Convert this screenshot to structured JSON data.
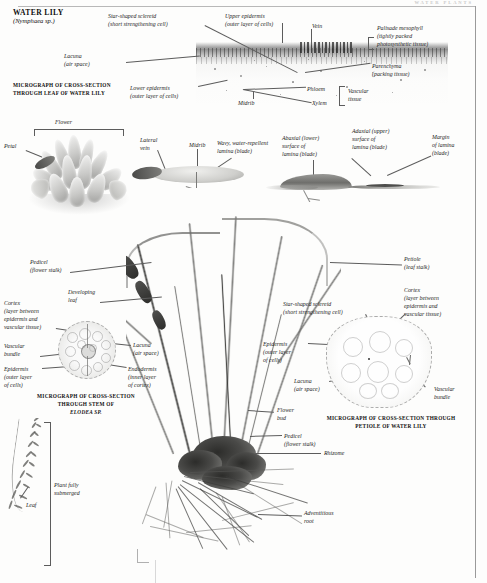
{
  "page": {
    "running_head": "WATER PLANTS",
    "title": "WATER LILY",
    "subtitle": "(Nymphaea sp.)"
  },
  "captions": [
    {
      "id": "leaf-micrograph",
      "line1": "MICROGRAPH OF CROSS-SECTION",
      "line2": "THROUGH LEAF OF WATER LILY"
    },
    {
      "id": "stem-micrograph",
      "line1": "MICROGRAPH OF CROSS-SECTION",
      "line2": "THROUGH STEM OF",
      "line3": "ELODEA SP."
    },
    {
      "id": "petiole-micrograph",
      "line1": "MICROGRAPH OF CROSS-SECTION THROUGH",
      "line2": "PETIOLE OF WATER LILY"
    }
  ],
  "labels": {
    "sclereid_top": "Star-shaped sclereid\n(short strengthening cell)",
    "upper_epidermis": "Upper epidermis\n(outer layer of cells)",
    "vein": "Vein",
    "palisade": "Palisade mesophyll\n(tightly packed\nphotosynthetic tissue)",
    "lacuna_top": "Lacuna\n(air space)",
    "lower_epidermis": "Lower epidermis\n(outer layer of cells)",
    "parenchyma": "Parenchyma\n(packing tissue)",
    "phloem": "Phloem",
    "xylem": "Xylem",
    "midrib_top": "Midrib",
    "vascular_tissue": "Vascular\ntissue",
    "flower": "Flower",
    "petal": "Petal",
    "lateral_vein": "Lateral\nvein",
    "midrib_mid": "Midrib",
    "wavy_lamina": "Wavy, water-repellent\nlamina (blade)",
    "abaxial": "Abaxial (lower)\nsurface of\nlamina (blade)",
    "adaxial": "Adaxial (upper)\nsurface of\nlamina (blade)",
    "margin": "Margin\nof lamina\n(blade)",
    "pedicel_upper": "Pedicel\n(flower stalk)",
    "developing_leaf": "Developing\nleaf",
    "cortex_stem": "Cortex\n(layer between\nepidermis and\nvascular tissue)",
    "vascular_bundle_stem": "Vascular\nbundle",
    "epidermis_stem": "Epidermis\n(outer layer\nof cells)",
    "lacuna_stem": "Lacuna\n(air space)",
    "endodermis": "Endodermis\n(inner layer\nof cortex)",
    "petiole": "Petiole\n(leaf stalk)",
    "cortex_petiole": "Cortex\n(layer between\nepidermis and\nvascular tissue)",
    "sclereid_petiole": "Star-shaped sclereid\n(short strengthening cell)",
    "epidermis_petiole": "Epidermis\n(outer layer\nof cells)",
    "lacuna_petiole": "Lacuna\n(air space)",
    "vascular_bundle_petiole": "Vascular\nbundle",
    "flower_bud": "Flower\nbud",
    "pedicel_lower": "Pedicel\n(flower stalk)",
    "rhizome": "Rhizome",
    "adventitious_root": "Adventitious\nroot",
    "plant_submerged": "Plant fully\nsubmerged",
    "leaf_elodea": "Leaf"
  },
  "colors": {
    "ink": "#1a1a1a",
    "leader": "#5c5c5c",
    "paper": "#fdfdfc",
    "rule": "#9a9a9a"
  }
}
